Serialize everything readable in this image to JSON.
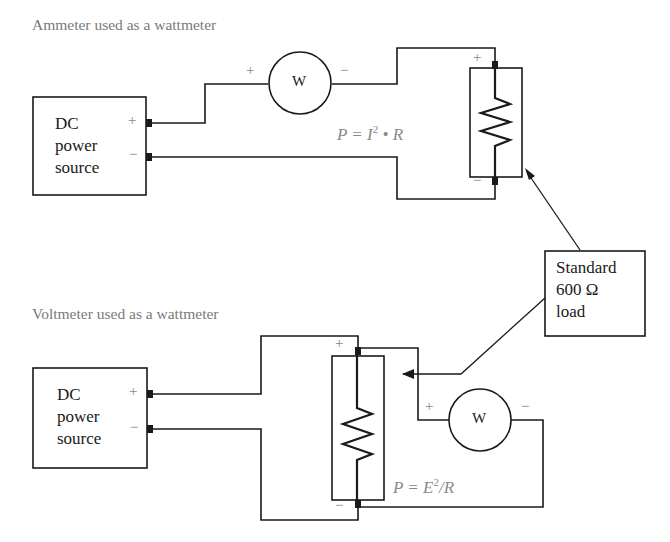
{
  "top_circuit": {
    "title": "Ammeter used as a wattmeter",
    "source": {
      "line1": "DC",
      "line2": "power",
      "line3": "source",
      "plus": "+",
      "minus": "−"
    },
    "meter": {
      "label": "W",
      "plus": "+",
      "minus": "−"
    },
    "load": {
      "plus": "+",
      "minus": "−"
    },
    "formula": {
      "prefix": "P = I",
      "sup": "2",
      "suffix": " • R"
    }
  },
  "bottom_circuit": {
    "title": "Voltmeter used as a wattmeter",
    "source": {
      "line1": "DC",
      "line2": "power",
      "line3": "source",
      "plus": "+",
      "minus": "−"
    },
    "meter": {
      "label": "W",
      "plus": "+",
      "minus": "−"
    },
    "load": {
      "plus": "+",
      "minus": "−"
    },
    "formula": {
      "prefix": "P = E",
      "sup": "2",
      "suffix": "/R"
    }
  },
  "callout": {
    "line1": "Standard",
    "line2": "600 Ω",
    "line3": "load"
  },
  "colors": {
    "line": "#1a1a1a",
    "title": "#7a7a7a",
    "formula": "#8a8a8a"
  }
}
